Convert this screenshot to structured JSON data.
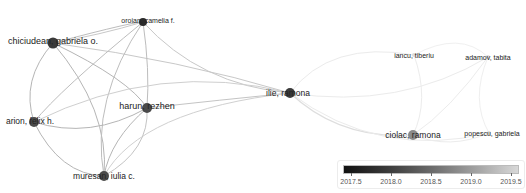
{
  "nodes": [
    {
      "id": "chiciudean",
      "label": "chiciudean, gabriela o.",
      "x": 53,
      "y": 43,
      "r": 5.5,
      "color": "#3a3a3a",
      "font": 9,
      "lx": 53,
      "ly": 41
    },
    {
      "id": "oroian",
      "label": "oroian, camelia f.",
      "x": 143,
      "y": 22,
      "r": 4,
      "color": "#2a2a2a",
      "font": 7,
      "lx": 148,
      "ly": 20
    },
    {
      "id": "arion",
      "label": "arion, felix h.",
      "x": 34,
      "y": 122,
      "r": 5,
      "color": "#4a4a4a",
      "font": 8.5,
      "lx": 30,
      "ly": 121
    },
    {
      "id": "harun",
      "label": "harun, rezhen",
      "x": 147,
      "y": 108,
      "r": 5,
      "color": "#4a4a4a",
      "font": 9,
      "lx": 147,
      "ly": 106
    },
    {
      "id": "muresan",
      "label": "muresan, iulia c.",
      "x": 104,
      "y": 176,
      "r": 5,
      "color": "#4a4a4a",
      "font": 8.5,
      "lx": 104,
      "ly": 176
    },
    {
      "id": "ilie",
      "label": "ilie, ramona",
      "x": 290,
      "y": 93,
      "r": 5,
      "color": "#3a3a3a",
      "font": 8.5,
      "lx": 288,
      "ly": 93
    },
    {
      "id": "iancu",
      "label": "iancu, tiberiu",
      "x": 414,
      "y": 55,
      "r": 2,
      "color": "#dcdcdc",
      "font": 7,
      "lx": 414,
      "ly": 55
    },
    {
      "id": "adamov",
      "label": "adamov, tabita",
      "x": 488,
      "y": 57,
      "r": 2,
      "color": "#dcdcdc",
      "font": 7,
      "lx": 488,
      "ly": 57
    },
    {
      "id": "ciolac",
      "label": "ciolac, ramona",
      "x": 413,
      "y": 135,
      "r": 5,
      "color": "#8a8a8a",
      "font": 8.5,
      "lx": 413,
      "ly": 135
    },
    {
      "id": "popescu",
      "label": "popescu, gabriela",
      "x": 489,
      "y": 133,
      "r": 2,
      "color": "#dcdcdc",
      "font": 7,
      "lx": 492,
      "ly": 133
    }
  ],
  "edges": [
    {
      "d": "M53,43 Q140,20 143,22",
      "color": "#bdbdbd",
      "w": 1
    },
    {
      "d": "M53,43 Q20,80 34,122",
      "color": "#b5b5b5",
      "w": 1
    },
    {
      "d": "M53,43 Q130,80 147,108",
      "color": "#b5b5b5",
      "w": 1
    },
    {
      "d": "M53,43 Q110,110 104,176",
      "color": "#b5b5b5",
      "w": 1
    },
    {
      "d": "M53,43 Q180,60 290,93",
      "color": "#c8c8c8",
      "w": 1
    },
    {
      "d": "M143,22 Q60,90 34,122",
      "color": "#bdbdbd",
      "w": 1
    },
    {
      "d": "M143,22 Q150,70 147,108",
      "color": "#bdbdbd",
      "w": 1
    },
    {
      "d": "M143,22 Q90,100 104,176",
      "color": "#bdbdbd",
      "w": 1
    },
    {
      "d": "M143,22 Q200,85 290,93",
      "color": "#c8c8c8",
      "w": 1
    },
    {
      "d": "M143,22 Q100,35 53,43",
      "color": "#c8c8c8",
      "w": 1
    },
    {
      "d": "M34,122 Q90,140 147,108",
      "color": "#b5b5b5",
      "w": 1
    },
    {
      "d": "M34,122 Q60,175 104,176",
      "color": "#b5b5b5",
      "w": 1
    },
    {
      "d": "M34,122 Q160,60 290,93",
      "color": "#cfcfcf",
      "w": 1
    },
    {
      "d": "M147,108 Q110,140 104,176",
      "color": "#b5b5b5",
      "w": 1
    },
    {
      "d": "M147,108 Q220,100 290,93",
      "color": "#c4c4c4",
      "w": 1
    },
    {
      "d": "M104,176 Q140,110 290,93",
      "color": "#d0d0d0",
      "w": 1
    },
    {
      "d": "M104,176 Q150,150 147,108",
      "color": "#c4c4c4",
      "w": 1
    },
    {
      "d": "M290,93 Q330,40 414,55",
      "color": "#ebebeb",
      "w": 1
    },
    {
      "d": "M290,93 Q400,110 488,57",
      "color": "#ebebeb",
      "w": 1
    },
    {
      "d": "M290,93 Q340,140 413,135",
      "color": "#dedede",
      "w": 1.2
    },
    {
      "d": "M290,93 Q380,160 489,133",
      "color": "#ebebeb",
      "w": 1
    },
    {
      "d": "M414,55 Q430,100 413,135",
      "color": "#ececec",
      "w": 1
    },
    {
      "d": "M488,57 Q450,110 413,135",
      "color": "#ececec",
      "w": 1
    },
    {
      "d": "M488,57 Q470,100 489,133",
      "color": "#efefef",
      "w": 1
    },
    {
      "d": "M413,135 Q450,150 489,133",
      "color": "#ececec",
      "w": 1
    },
    {
      "d": "M414,55 Q460,30 488,57",
      "color": "#f0f0f0",
      "w": 1
    }
  ],
  "legend": {
    "type": "color-scale",
    "min": 2017.4,
    "max": 2019.6,
    "ticks": [
      "2017.5",
      "2018.0",
      "2018.5",
      "2019.0",
      "2019.5"
    ],
    "colors": [
      "#111111",
      "#d8d8d8"
    ]
  }
}
